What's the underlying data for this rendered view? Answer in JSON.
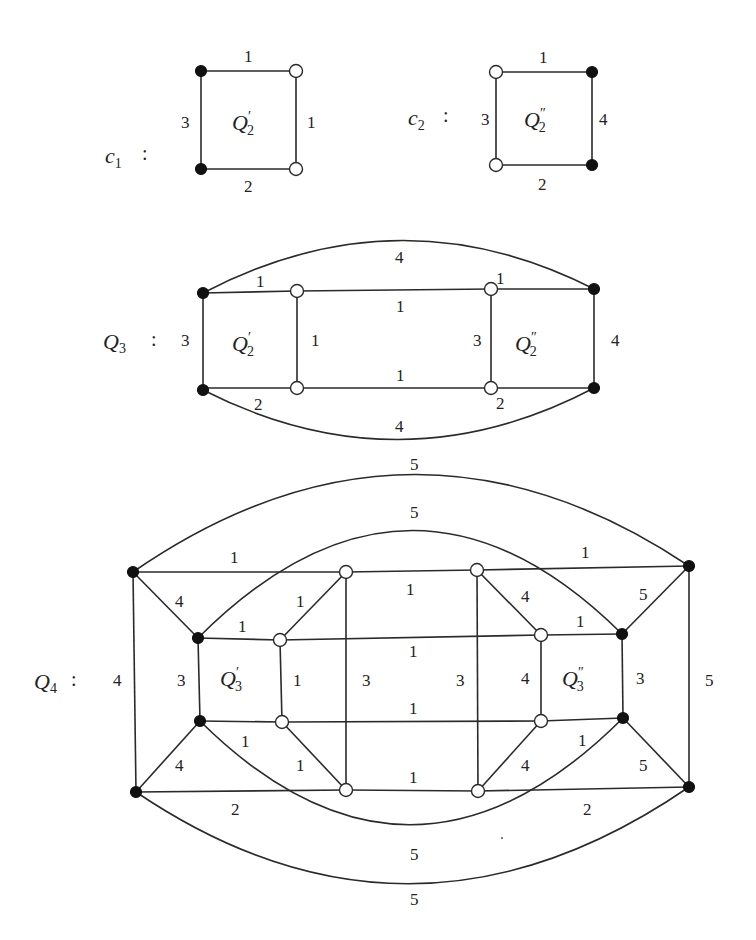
{
  "figure": {
    "c1": {
      "name": "c",
      "subscript": "1",
      "colon": ":",
      "inner_label": "Q",
      "inner_sub": "2",
      "inner_prime": "′",
      "edge_labels": {
        "top": "1",
        "right": "1",
        "bottom": "2",
        "left": "3"
      }
    },
    "c2": {
      "name": "c",
      "subscript": "2",
      "colon": ":",
      "inner_label": "Q",
      "inner_sub": "2",
      "inner_prime": "″",
      "edge_labels": {
        "top": "1",
        "right": "4",
        "bottom": "2",
        "left": "3"
      }
    },
    "q3": {
      "name": "Q",
      "subscript": "3",
      "colon": ":",
      "left_inner": {
        "label": "Q",
        "sub": "2",
        "prime": "′"
      },
      "right_inner": {
        "label": "Q",
        "sub": "2",
        "prime": "″"
      },
      "edge_labels": {
        "arc_top": "4",
        "arc_bottom": "4",
        "left_top": "1",
        "left_bottom": "2",
        "left_side": "3",
        "left_inner_side": "1",
        "mid_top": "1",
        "mid_bottom": "1",
        "right_inner_side": "3",
        "right_top": "1",
        "right_bottom": "2",
        "right_side": "4"
      }
    },
    "q4": {
      "name": "Q",
      "subscript": "4",
      "colon": ":",
      "left_inner": {
        "label": "Q",
        "sub": "3",
        "prime": "′"
      },
      "right_inner": {
        "label": "Q",
        "sub": "3",
        "prime": "″"
      },
      "edge_labels": {
        "outer_arc_top": "5",
        "inner_arc_top": "5",
        "inner_arc_bottom": "5",
        "outer_arc_bottom": "5",
        "top_left": "1",
        "top_right": "1",
        "top_mid": "1",
        "bottom_left": "2",
        "bottom_right": "2",
        "bottom_mid": "1",
        "outer_left_side": "4",
        "outer_right_side": "5",
        "diag_tl": "4",
        "diag_bl": "4",
        "diag_tr": "5",
        "diag_br": "5",
        "inner_left_top": "1",
        "inner_left_bottom": "1",
        "inner_left_side": "3",
        "inner_left_open_side": "1",
        "diag_open_tl": "1",
        "diag_open_bl": "1",
        "mid_row_top": "1",
        "mid_row_bottom": "1",
        "mid_left_vertical": "3",
        "mid_right_vertical": "3",
        "diag_open_tr": "4",
        "diag_open_br": "4",
        "inner_right_open_side": "4",
        "inner_right_top": "1",
        "inner_right_bottom": "1",
        "inner_right_side": "3"
      }
    },
    "colors": {
      "line": "#2a2a2a",
      "filled_node": "#111111",
      "open_node": "#ffffff",
      "background": "#ffffff"
    }
  }
}
